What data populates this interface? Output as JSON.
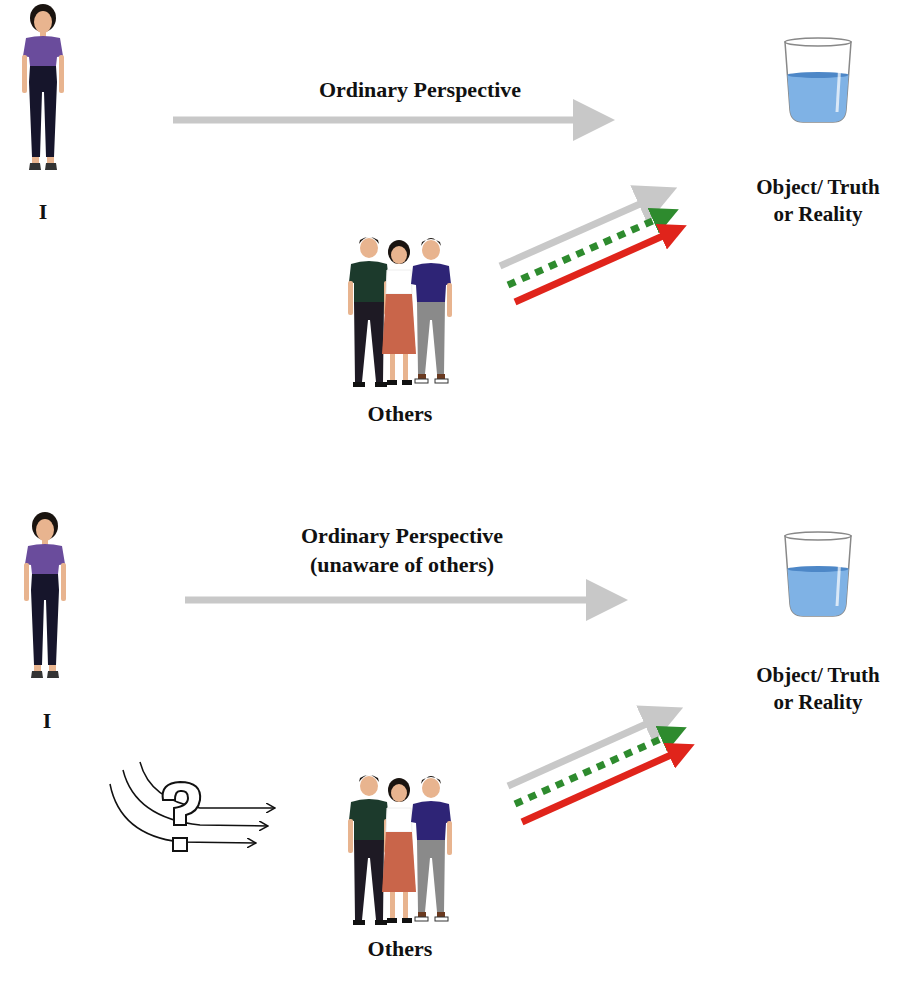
{
  "top_panel": {
    "self_label": "I",
    "arrow_label": "Ordinary Perspective",
    "others_label": "Others",
    "object_label_line1": "Object/ Truth",
    "object_label_line2": "or Reality"
  },
  "bottom_panel": {
    "self_label": "I",
    "arrow_label_line1": "Ordinary Perspective",
    "arrow_label_line2": "(unaware of others)",
    "others_label": "Others",
    "object_label_line1": "Object/ Truth",
    "object_label_line2": "or Reality",
    "confusion_symbol": "question-mark"
  },
  "colors": {
    "arrow_gray": "#c8c8c8",
    "arrow_green": "#2e8b2e",
    "arrow_red": "#e0241b",
    "water_blue": "#7fb2e5",
    "water_top": "#4d87c7",
    "shirt_purple": "#6a4c9c",
    "pants_navy": "#16152b",
    "shirt_darkgreen": "#1c3a2c",
    "skirt_terracotta": "#c9654a",
    "shirt_indigo": "#2e2476",
    "pants_gray": "#8a8a8a",
    "skin": "#e8b48f",
    "hair": "#1a1410"
  }
}
